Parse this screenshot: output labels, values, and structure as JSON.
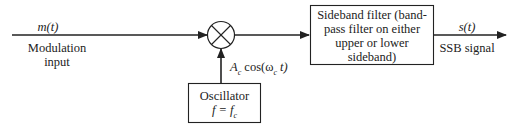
{
  "diagram": {
    "input": {
      "signal": "m(t)",
      "label_line1": "Modulation",
      "label_line2": "input"
    },
    "mixer": {
      "symbol": "multiplier"
    },
    "carrier": {
      "label": "A_c cos(ω_c t)",
      "prefix": "A",
      "sub": "c",
      "func": " cos(ω",
      "sub2": "c",
      "suffix": " t)"
    },
    "oscillator": {
      "label": "Oscillator",
      "freq": "f = f_c",
      "freq_main": "f = f",
      "freq_sub": "c"
    },
    "filter": {
      "lines": [
        "Sideband filter (band-",
        "pass filter on either",
        "upper or lower",
        "sideband)"
      ]
    },
    "output": {
      "signal": "s(t)",
      "label": "SSB signal"
    },
    "colors": {
      "line": "#222222",
      "background": "#ffffff"
    }
  }
}
